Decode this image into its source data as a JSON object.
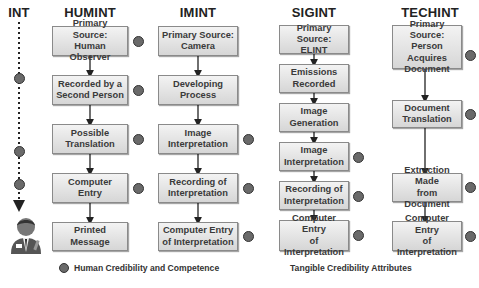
{
  "columns": [
    {
      "key": "int",
      "title": "INT"
    },
    {
      "key": "humint",
      "title": "HUMINT",
      "steps": [
        {
          "label": "Primary Source:\nHuman Observer",
          "marker": "circle"
        },
        {
          "label": "Recorded by a\nSecond Person",
          "marker": "circle"
        },
        {
          "label": "Possible\nTranslation",
          "marker": "circle"
        },
        {
          "label": "Computer\nEntry",
          "marker": "circle"
        },
        {
          "label": "Printed\nMessage",
          "marker": "triangle"
        }
      ]
    },
    {
      "key": "imint",
      "title": "IMINT",
      "steps": [
        {
          "label": "Primary Source:\nCamera",
          "marker": "triangle"
        },
        {
          "label": "Developing\nProcess",
          "marker": "triangle"
        },
        {
          "label": "Image\nInterpretation",
          "marker": "circle"
        },
        {
          "label": "Recording of\nInterpretation",
          "marker": "circle"
        },
        {
          "label": "Computer Entry\nof Interpretation",
          "marker": "circle"
        }
      ]
    },
    {
      "key": "sigint",
      "title": "SIGINT",
      "steps": [
        {
          "label": "Primary Source:\nELINT",
          "marker": "triangle"
        },
        {
          "label": "Emissions\nRecorded",
          "marker": "triangle"
        },
        {
          "label": "Image\nGeneration",
          "marker": "triangle"
        },
        {
          "label": "Image\nInterpretation",
          "marker": "circle"
        },
        {
          "label": "Recording of\nInterpretation",
          "marker": "circle"
        },
        {
          "label": "Computer Entry\nof Interpretation",
          "marker": "circle"
        }
      ]
    },
    {
      "key": "techint",
      "title": "TECHINT",
      "steps": [
        {
          "label": "Primary Source:\nPerson Acquires\nDocument",
          "marker": "triangle+circle"
        },
        {
          "label": "Document\nTranslation",
          "marker": "circle"
        },
        {
          "label": "Extraction Made\nfrom Document",
          "marker": "circle"
        },
        {
          "label": "Computer Entry\nof Interpretation",
          "marker": "circle"
        }
      ]
    }
  ],
  "int_chain": [
    "triangle",
    "circle",
    "triangle",
    "circle",
    "circle",
    "person"
  ],
  "legend": {
    "circle_label": "Human Credibility and Competence",
    "triangle_label": "Tangible Credibility Attributes"
  },
  "colors": {
    "box_top": "#f3f3f3",
    "box_bottom": "#d6d6d6",
    "circle": "#6a6a6a",
    "border": "#8a8a8a"
  }
}
